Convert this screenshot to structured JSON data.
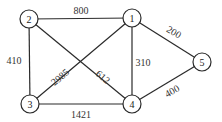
{
  "graph": {
    "type": "undirected-weighted",
    "nodes": [
      {
        "id": "1",
        "label": "1",
        "x": 132,
        "y": 18
      },
      {
        "id": "2",
        "label": "2",
        "x": 29,
        "y": 19
      },
      {
        "id": "3",
        "label": "3",
        "x": 30,
        "y": 104
      },
      {
        "id": "4",
        "label": "4",
        "x": 132,
        "y": 104
      },
      {
        "id": "5",
        "label": "5",
        "x": 202,
        "y": 62
      }
    ],
    "edges": [
      {
        "from": "2",
        "to": "1",
        "weight": "800",
        "lx": 81,
        "ly": 10,
        "rot": 0
      },
      {
        "from": "2",
        "to": "3",
        "weight": "410",
        "lx": 14,
        "ly": 60,
        "rot": 0
      },
      {
        "from": "2",
        "to": "4",
        "weight": "612",
        "lx": 103,
        "ly": 77,
        "rot": 40
      },
      {
        "from": "3",
        "to": "1",
        "weight": "2985",
        "lx": 60,
        "ly": 77,
        "rot": -40
      },
      {
        "from": "1",
        "to": "4",
        "weight": "310",
        "lx": 143,
        "ly": 62,
        "rot": 0
      },
      {
        "from": "1",
        "to": "5",
        "weight": "200",
        "lx": 174,
        "ly": 32,
        "rot": 30
      },
      {
        "from": "3",
        "to": "4",
        "weight": "1421",
        "lx": 81,
        "ly": 114,
        "rot": 0
      },
      {
        "from": "4",
        "to": "5",
        "weight": "400",
        "lx": 172,
        "ly": 91,
        "rot": -30
      }
    ]
  }
}
